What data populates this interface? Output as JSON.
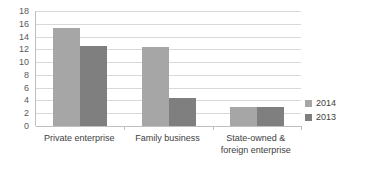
{
  "chart_data": {
    "type": "bar",
    "title": "",
    "subtitle": "",
    "xlabel": "",
    "ylabel": "",
    "ylim": [
      0,
      18
    ],
    "ytick_step": 2,
    "yticks": [
      "18",
      "16",
      "14",
      "12",
      "10",
      "8",
      "6",
      "4",
      "2",
      "0"
    ],
    "grid": true,
    "legend_position": "right",
    "categories": [
      "Private enterprise",
      "Family business",
      "State-owned & foreign enterprise"
    ],
    "category_lines": [
      [
        "Private enterprise"
      ],
      [
        "Family business"
      ],
      [
        "State-owned &",
        "foreign enterprise"
      ]
    ],
    "series": [
      {
        "name": "2014",
        "color": "#a6a6a6",
        "values": [
          15.3,
          12.4,
          3.0
        ]
      },
      {
        "name": "2013",
        "color": "#7f7f7f",
        "values": [
          12.5,
          4.4,
          3.0
        ]
      }
    ]
  },
  "legend": {
    "items": [
      {
        "label": "2014",
        "color": "#a6a6a6"
      },
      {
        "label": "2013",
        "color": "#7f7f7f"
      }
    ]
  },
  "colors": {
    "series_2014": "#a6a6a6",
    "series_2013": "#7f7f7f",
    "gridline": "#d9d9d9",
    "axis": "#bfbfbf",
    "tick_text": "#595959",
    "label_text": "#404040",
    "background": "#ffffff"
  }
}
